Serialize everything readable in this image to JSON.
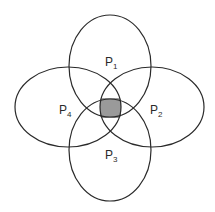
{
  "diagram": {
    "type": "venn",
    "sets": [
      {
        "id": "p1",
        "label": "P",
        "subscript": "1",
        "position": "top"
      },
      {
        "id": "p2",
        "label": "P",
        "subscript": "2",
        "position": "right"
      },
      {
        "id": "p3",
        "label": "P",
        "subscript": "3",
        "position": "bottom"
      },
      {
        "id": "p4",
        "label": "P",
        "subscript": "4",
        "position": "left"
      }
    ],
    "highlighted_region": "intersection of P1, P2, P3, P4",
    "colors": {
      "stroke": "#2a2a2a",
      "fill_highlight": "#9a9a9a",
      "background": "#ffffff"
    }
  }
}
